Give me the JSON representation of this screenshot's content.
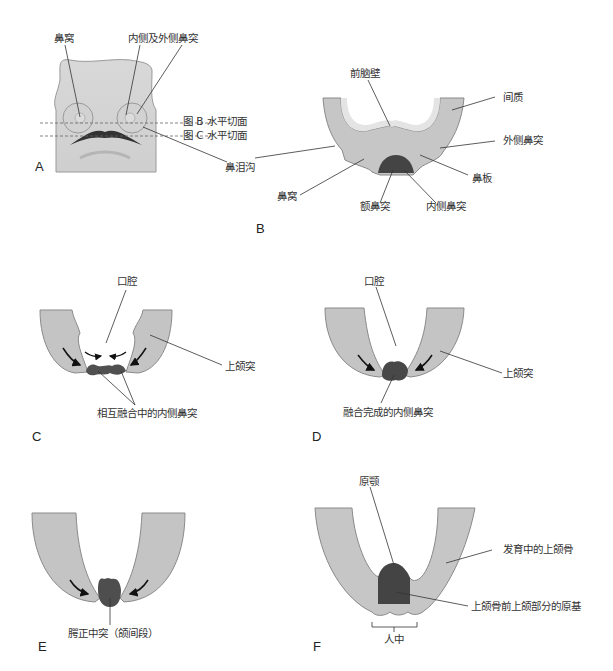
{
  "panels": {
    "A": {
      "letter": "A",
      "labels": {
        "nasal_pit": "鼻窝",
        "medial_lateral_nasal": "内侧及外侧鼻突",
        "plane_b": "图 B 水平切面",
        "plane_c": "图 C 水平切面",
        "nasolacrimal_groove": "鼻泪沟"
      }
    },
    "B": {
      "letter": "B",
      "labels": {
        "forebrain_wall": "前脑壁",
        "mesenchyme": "间质",
        "lateral_nasal": "外侧鼻突",
        "nasal_placode": "鼻板",
        "nasal_pit": "鼻窝",
        "frontonasal": "额鼻突",
        "medial_nasal": "内侧鼻突"
      }
    },
    "C": {
      "letter": "C",
      "labels": {
        "oral_cavity": "口腔",
        "maxillary": "上颌突",
        "fusing_medial_nasal": "相互融合中的内侧鼻突"
      }
    },
    "D": {
      "letter": "D",
      "labels": {
        "oral_cavity": "口腔",
        "maxillary": "上颌突",
        "fused_medial_nasal": "融合完成的内侧鼻突"
      }
    },
    "E": {
      "letter": "E",
      "labels": {
        "intermaxillary": "腭正中突（颌间段）"
      }
    },
    "F": {
      "letter": "F",
      "labels": {
        "primary_palate": "原颚",
        "developing_maxilla": "发育中的上颌骨",
        "premaxilla_primordium": "上颌骨前上颌部分的原基",
        "philtrum": "人中"
      }
    }
  },
  "colors": {
    "tissue_fill": "#c4c4c4",
    "tissue_outline": "#8a8a8a",
    "dark_tissue": "#4a4a4a",
    "inner_layer": "#e2e2e2",
    "leader_line": "#333333"
  }
}
